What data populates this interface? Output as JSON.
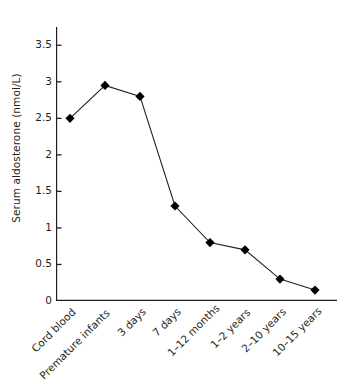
{
  "chart_data": {
    "type": "line",
    "title": "",
    "subtitle": "",
    "xlabel": "",
    "ylabel": "Serum aldosterone (nmol/L)",
    "categories": [
      "Cord blood",
      "Premature infants",
      "3 days",
      "7 days",
      "1–12 months",
      "1–2 years",
      "2–10 years",
      "10–15 years"
    ],
    "values": [
      2.5,
      2.95,
      2.8,
      1.3,
      0.8,
      0.7,
      0.3,
      0.15
    ],
    "ylim": [
      0,
      3.75
    ],
    "yticks": [
      0,
      0.5,
      1,
      1.5,
      2,
      2.5,
      3,
      3.5
    ],
    "ytick_labels": [
      "0",
      "0.5",
      "1",
      "1.5",
      "2",
      "2.5",
      "3",
      "3.5"
    ],
    "grid": false,
    "legend": null,
    "marker": "diamond",
    "line_color": "#231f20",
    "marker_color": "#000000",
    "axis_color": "#231f20",
    "background": "#ffffff"
  }
}
